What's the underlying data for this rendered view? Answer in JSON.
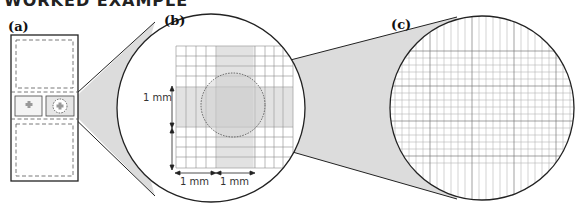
{
  "header": {
    "cut_title": "WORKED EXAMPLE"
  },
  "panels": {
    "a": {
      "label": "(a)",
      "description": "hemocytometer slide with two counting chambers"
    },
    "b": {
      "label": "(b)",
      "description": "magnified counting grid"
    },
    "c": {
      "label": "(c)",
      "description": "further magnified central square"
    }
  },
  "scale_bars": {
    "vertical": "1 mm",
    "horizontal_left": "1 mm",
    "horizontal_right": "1 mm"
  },
  "colors": {
    "outline": "#222222",
    "grid_line": "#8a8a8a",
    "fine_grid": "#b5b5b5",
    "magnifier_fill": "#dcdcdc",
    "dashed": "#555555"
  }
}
